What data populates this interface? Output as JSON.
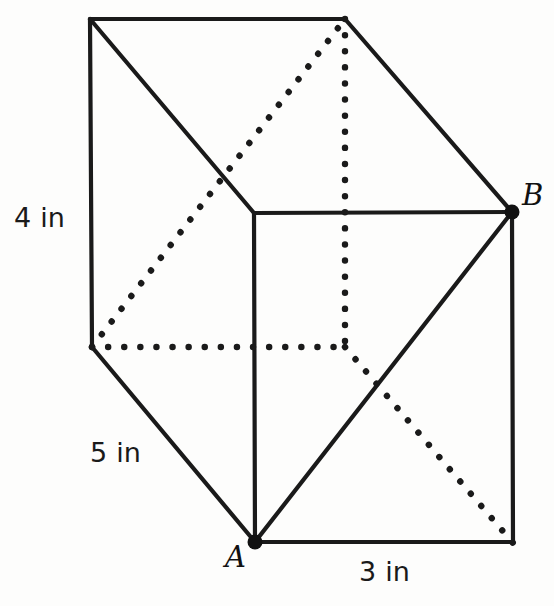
{
  "figure": {
    "type": "rectangular-prism-diagram",
    "background_color": "#fdfdfc",
    "stroke_color": "#1a1a1a",
    "hidden_edge_style": "dotted",
    "visible_edge_style": "solid"
  },
  "dimensions": {
    "height": {
      "text": "4 in",
      "value": 4,
      "unit": "in",
      "edge": "left-vertical"
    },
    "depth": {
      "text": "5 in",
      "value": 5,
      "unit": "in",
      "edge": "bottom-left-diagonal"
    },
    "width": {
      "text": "3 in",
      "value": 3,
      "unit": "in",
      "edge": "bottom-front"
    }
  },
  "points": {
    "a": {
      "label": "A",
      "position": "front-bottom-left"
    },
    "b": {
      "label": "B",
      "position": "front-top-right"
    }
  },
  "vertices": {
    "back_top_left": [
      90,
      19
    ],
    "back_top_right": [
      345,
      19
    ],
    "front_top_left": [
      254,
      213
    ],
    "front_top_right": [
      512,
      212
    ],
    "back_bottom_left": [
      92,
      347
    ],
    "back_bottom_right": [
      345,
      347
    ],
    "front_bottom_left": [
      255,
      542
    ],
    "front_bottom_right": [
      513,
      542
    ]
  }
}
